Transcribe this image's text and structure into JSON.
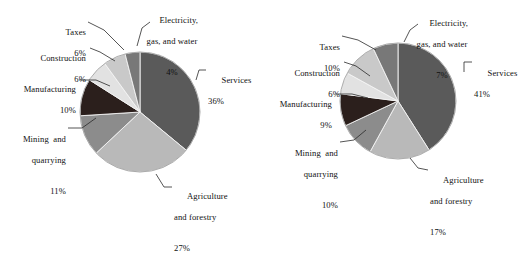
{
  "figure": {
    "width": 516,
    "height": 223,
    "background": "#ffffff",
    "text_color": "#111111"
  },
  "chart_data": [
    {
      "type": "pie",
      "name": "left-pie-chart",
      "title": "",
      "legend_position": "callout-labels",
      "start_angle_deg": 0,
      "direction": "clockwise",
      "center": {
        "x": 140,
        "y": 112
      },
      "radius": 60,
      "categories": [
        "Services",
        "Agriculture and forestry",
        "Mining and quarrying",
        "Manufacturing",
        "Construction",
        "Taxes",
        "Electricity, gas, and water"
      ],
      "values": [
        36,
        27,
        11,
        10,
        6,
        6,
        4
      ],
      "value_suffix": "%",
      "colors": [
        "#5a5a5a",
        "#b9b9b9",
        "#8c8c8c",
        "#2b1f1c",
        "#e2e2e2",
        "#c9c9c9",
        "#787878"
      ],
      "labels": [
        {
          "name": "Services",
          "line1": "Services",
          "line2": "",
          "pct": "36%"
        },
        {
          "name": "Agriculture and forestry",
          "line1": "Agriculture",
          "line2": "and forestry",
          "pct": "27%"
        },
        {
          "name": "Mining and quarrying",
          "line1": "Mining  and",
          "line2": "quarrying",
          "pct": "11%"
        },
        {
          "name": "Manufacturing",
          "line1": "Manufacturing",
          "line2": "",
          "pct": "10%"
        },
        {
          "name": "Construction",
          "line1": "Construction",
          "line2": "",
          "pct": "6%"
        },
        {
          "name": "Taxes",
          "line1": "Taxes",
          "line2": "",
          "pct": "6%"
        },
        {
          "name": "Electricity, gas, and water",
          "line1": "Electricity,",
          "line2": "gas, and water",
          "pct": "4%"
        }
      ]
    },
    {
      "type": "pie",
      "name": "right-pie-chart",
      "title": "",
      "legend_position": "callout-labels",
      "start_angle_deg": 0,
      "direction": "clockwise",
      "center": {
        "x": 398,
        "y": 101
      },
      "radius": 58,
      "categories": [
        "Services",
        "Agriculture and forestry",
        "Mining and quarrying",
        "Manufacturing",
        "Construction",
        "Taxes",
        "Electricity, gas, and water"
      ],
      "values": [
        41,
        17,
        10,
        9,
        6,
        10,
        7
      ],
      "value_suffix": "%",
      "colors": [
        "#5a5a5a",
        "#b9b9b9",
        "#8c8c8c",
        "#2b1f1c",
        "#e2e2e2",
        "#c9c9c9",
        "#787878"
      ],
      "labels": [
        {
          "name": "Services",
          "line1": "Services",
          "line2": "",
          "pct": "41%"
        },
        {
          "name": "Agriculture and forestry",
          "line1": "Agriculture",
          "line2": "and forestry",
          "pct": "17%"
        },
        {
          "name": "Mining and quarrying",
          "line1": "Mining  and",
          "line2": "quarrying",
          "pct": "10%"
        },
        {
          "name": "Manufacturing",
          "line1": "Manufacturing",
          "line2": "",
          "pct": "9%"
        },
        {
          "name": "Construction",
          "line1": "Construction",
          "line2": "",
          "pct": "6%"
        },
        {
          "name": "Taxes",
          "line1": "Taxes",
          "line2": "",
          "pct": "10%"
        },
        {
          "name": "Electricity, gas, and water",
          "line1": "Electricity,",
          "line2": "gas, and water",
          "pct": "7%"
        }
      ]
    }
  ],
  "left_chart": {
    "services": {
      "l1": "Services",
      "l2": "",
      "pct": "36%"
    },
    "agriculture": {
      "l1": "Agriculture",
      "l2": "and forestry",
      "pct": "27%"
    },
    "mining": {
      "l1": "Mining  and",
      "l2": "quarrying",
      "pct": "11%"
    },
    "manufacturing": {
      "l1": "Manufacturing",
      "l2": "",
      "pct": "10%"
    },
    "construction": {
      "l1": "Construction",
      "l2": "",
      "pct": "6%"
    },
    "taxes": {
      "l1": "Taxes",
      "l2": "",
      "pct": "6%"
    },
    "electricity": {
      "l1": "Electricity,",
      "l2": "gas, and water",
      "pct": "4%"
    }
  },
  "right_chart": {
    "services": {
      "l1": "Services",
      "l2": "",
      "pct": "41%"
    },
    "agriculture": {
      "l1": "Agriculture",
      "l2": "and forestry",
      "pct": "17%"
    },
    "mining": {
      "l1": "Mining  and",
      "l2": "quarrying",
      "pct": "10%"
    },
    "manufacturing": {
      "l1": "Manufacturing",
      "l2": "",
      "pct": "9%"
    },
    "construction": {
      "l1": "Construction",
      "l2": "",
      "pct": "6%"
    },
    "taxes": {
      "l1": "Taxes",
      "l2": "",
      "pct": "10%"
    },
    "electricity": {
      "l1": "Electricity,",
      "l2": "gas, and water",
      "pct": "7%"
    }
  }
}
